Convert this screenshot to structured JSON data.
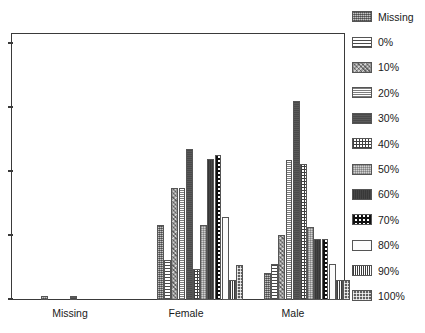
{
  "chart_data": {
    "type": "bar",
    "title": "",
    "subtitle": "",
    "xlabel": "",
    "ylabel": "",
    "grid": false,
    "legend_position": "right",
    "axis": {
      "y_tick_labels": [],
      "y_tick_count": 5,
      "x_tick_labels": [
        "Missing",
        "Female",
        "Male"
      ]
    },
    "categories": [
      "Missing",
      "Female",
      "Male"
    ],
    "series": [
      {
        "name": "Missing",
        "pattern": "dotted-grey",
        "values": [
          1.6,
          28.0,
          10.0
        ]
      },
      {
        "name": "0%",
        "pattern": "horizontal-lines",
        "values": [
          0.0,
          15.0,
          13.5
        ]
      },
      {
        "name": "10%",
        "pattern": "coarse-speckle",
        "values": [
          0.0,
          42.0,
          24.5
        ]
      },
      {
        "name": "20%",
        "pattern": "fine-horizontal",
        "values": [
          0.0,
          42.0,
          52.5
        ]
      },
      {
        "name": "30%",
        "pattern": "solid-dark-grey",
        "values": [
          1.6,
          56.5,
          74.5
        ]
      },
      {
        "name": "40%",
        "pattern": "brick-grid",
        "values": [
          0.0,
          11.5,
          51.0
        ]
      },
      {
        "name": "50%",
        "pattern": "light-checker",
        "values": [
          0.0,
          28.0,
          27.5
        ]
      },
      {
        "name": "60%",
        "pattern": "solid-very-dark",
        "values": [
          0.0,
          53.0,
          23.0
        ]
      },
      {
        "name": "70%",
        "pattern": "checkerboard",
        "values": [
          0.0,
          54.5,
          23.0
        ]
      },
      {
        "name": "80%",
        "pattern": "near-white",
        "values": [
          0.0,
          31.0,
          13.5
        ]
      },
      {
        "name": "90%",
        "pattern": "dense-grid",
        "values": [
          0.0,
          7.5,
          7.5
        ]
      },
      {
        "name": "100%",
        "pattern": "dark-dots",
        "values": [
          0.0,
          13.0,
          7.5
        ]
      }
    ],
    "ylim": [
      0,
      100
    ]
  },
  "legend": {
    "items": [
      {
        "label": "Missing",
        "pattern_class": "pat-missing"
      },
      {
        "label": "0%",
        "pattern_class": "pat-0"
      },
      {
        "label": "10%",
        "pattern_class": "pat-10"
      },
      {
        "label": "20%",
        "pattern_class": "pat-20"
      },
      {
        "label": "30%",
        "pattern_class": "pat-30"
      },
      {
        "label": "40%",
        "pattern_class": "pat-40"
      },
      {
        "label": "50%",
        "pattern_class": "pat-50"
      },
      {
        "label": "60%",
        "pattern_class": "pat-60"
      },
      {
        "label": "70%",
        "pattern_class": "pat-70"
      },
      {
        "label": "80%",
        "pattern_class": "pat-80"
      },
      {
        "label": "90%",
        "pattern_class": "pat-90"
      },
      {
        "label": "100%",
        "pattern_class": "pat-100"
      }
    ]
  },
  "layout": {
    "group_centers_px": [
      70,
      186,
      293
    ],
    "group_left_px": [
      30,
      146,
      253
    ],
    "bar_width_px": 6.8,
    "bar_gap_px": 0.4,
    "plot_height_px": 267,
    "value_scale_px_per_unit": 2.67,
    "tick_y_px": [
      8,
      72,
      136,
      200,
      264
    ]
  },
  "colors": {
    "frame": "#3a3a3a",
    "text": "#1a1a1a",
    "background": "#ffffff",
    "bar_outline": "#555555"
  }
}
